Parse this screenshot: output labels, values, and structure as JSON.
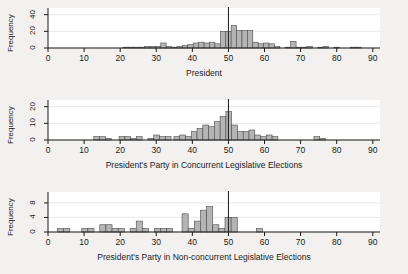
{
  "figure": {
    "background_color": "#f2f1ef",
    "plot_background_color": "#ffffff",
    "bar_fill_color": "#b4b4b4",
    "bar_stroke_color": "#4d4d4d",
    "axis_color": "#1a1a1a",
    "grid_color": "#e0dedb",
    "refline_color": "#1a1a1a"
  },
  "chart_data": [
    {
      "type": "bar",
      "title": "",
      "xlabel": "President",
      "ylabel": "Frequency",
      "xlim": [
        0,
        92
      ],
      "ylim": [
        0,
        48
      ],
      "xticks": [
        0,
        10,
        20,
        30,
        40,
        50,
        60,
        70,
        80,
        90
      ],
      "yticks": [
        0,
        20,
        40
      ],
      "grid": true,
      "bin_width": 1.5,
      "reference_line": 50,
      "x": [
        21.5,
        23,
        24.5,
        26,
        27.5,
        29,
        30.5,
        32,
        33.5,
        35,
        36.5,
        38,
        39.5,
        41,
        42.5,
        44,
        45.5,
        47,
        48.5,
        50,
        51.5,
        53,
        54.5,
        56,
        57.5,
        59,
        60.5,
        62,
        63.5,
        66.5,
        68,
        69.5,
        71,
        72.5,
        75.5,
        77,
        80,
        84.5,
        86
      ],
      "values": [
        1,
        1,
        1,
        1,
        2,
        2,
        2,
        6,
        2,
        1,
        2,
        3,
        4,
        6,
        7,
        6,
        7,
        5,
        20,
        20,
        27,
        21,
        21,
        21,
        7,
        5,
        6,
        5,
        2,
        1,
        8,
        1,
        1,
        2,
        1,
        2,
        1,
        1,
        1
      ]
    },
    {
      "type": "bar",
      "title": "",
      "xlabel": "President's Party in Concurrent Legislative Elections",
      "ylabel": "Frequency",
      "xlim": [
        0,
        92
      ],
      "ylim": [
        0,
        24
      ],
      "xticks": [
        0,
        10,
        20,
        30,
        40,
        50,
        60,
        70,
        80,
        90
      ],
      "yticks": [
        0,
        10,
        20
      ],
      "grid": true,
      "bin_width": 1.6,
      "reference_line": 50,
      "x": [
        13.5,
        15.1,
        16.7,
        20.5,
        22.1,
        23.7,
        25.3,
        28.5,
        30.1,
        31.7,
        33.3,
        35.7,
        37.3,
        38.9,
        40.5,
        42.1,
        43.7,
        45.3,
        46.9,
        48.5,
        50.1,
        51.7,
        53.3,
        54.9,
        56.5,
        58.1,
        59.7,
        61.3,
        62.9,
        74.5,
        76.1
      ],
      "values": [
        2,
        2,
        1,
        2,
        2,
        1,
        2,
        1,
        3,
        2,
        2,
        2,
        3,
        2,
        5,
        7,
        9,
        8,
        11,
        14,
        17,
        9,
        5,
        5,
        6,
        3,
        2,
        3,
        2,
        2,
        1
      ]
    },
    {
      "type": "bar",
      "title": "",
      "xlabel": "President's Party in Non-concurrent Legislative Elections",
      "ylabel": "Frequency",
      "xlim": [
        0,
        92
      ],
      "ylim": [
        0,
        11
      ],
      "xticks": [
        0,
        10,
        20,
        30,
        40,
        50,
        60,
        70,
        80,
        90
      ],
      "yticks": [
        0,
        4,
        8
      ],
      "grid": true,
      "bin_width": 1.7,
      "reference_line": 50,
      "x": [
        3.5,
        5.2,
        10.2,
        11.9,
        15.2,
        16.9,
        18.6,
        20.3,
        23.6,
        25.3,
        27,
        30.3,
        32,
        33.7,
        38,
        39.7,
        41.4,
        43.1,
        44.8,
        46.5,
        48.2,
        49.9,
        51.6,
        53.3,
        58.6
      ],
      "values": [
        1,
        1,
        1,
        1,
        2,
        2,
        1,
        1,
        1,
        3,
        1,
        1,
        1,
        1,
        5,
        1,
        3,
        6,
        7,
        2,
        1,
        4,
        4,
        0,
        1
      ]
    }
  ]
}
